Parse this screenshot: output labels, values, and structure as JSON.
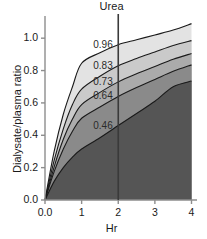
{
  "chart_data": {
    "type": "area",
    "title": "Urea",
    "xlabel": "Hr",
    "ylabel": "Dialysate/plasma ratio",
    "xlim": [
      0,
      4.15
    ],
    "ylim": [
      0,
      1.1
    ],
    "grid": false,
    "legend_position": "none",
    "xticks": [
      "0.0",
      "1",
      "2",
      "3",
      "4"
    ],
    "xtick_values": [
      0,
      1,
      2,
      3,
      4
    ],
    "yticks": [
      "0.0",
      "0.2",
      "0.4",
      "0.6",
      "0.8",
      "1.0"
    ],
    "ytick_values": [
      0.0,
      0.2,
      0.4,
      0.6,
      0.8,
      1.0
    ],
    "reference_line": {
      "orientation": "vertical",
      "x": 2,
      "label": "2 Hr transport category boundaries"
    },
    "x": [
      0,
      0.25,
      0.5,
      0.75,
      1.0,
      1.5,
      2.0,
      2.5,
      3.0,
      3.5,
      4.0
    ],
    "series": [
      {
        "name": "high (max)",
        "label_at_2hr": "0.96",
        "value_at_2hr": 0.96,
        "fill": "#e3e3e3",
        "values": [
          0.0,
          0.3,
          0.53,
          0.7,
          0.845,
          0.91,
          0.96,
          0.99,
          1.02,
          1.05,
          1.09
        ]
      },
      {
        "name": "high average upper",
        "label_at_2hr": "0.83",
        "value_at_2hr": 0.83,
        "fill": "#cacaca",
        "values": [
          0.0,
          0.245,
          0.44,
          0.59,
          0.685,
          0.765,
          0.83,
          0.875,
          0.915,
          0.955,
          0.985
        ]
      },
      {
        "name": "average",
        "label_at_2hr": "0.73",
        "value_at_2hr": 0.73,
        "fill": "#ababab",
        "values": [
          0.0,
          0.205,
          0.375,
          0.5,
          0.59,
          0.665,
          0.73,
          0.78,
          0.825,
          0.87,
          0.905
        ]
      },
      {
        "name": "low average",
        "label_at_2hr": "0.64",
        "value_at_2hr": 0.64,
        "fill": "#8a8a8a",
        "values": [
          0.0,
          0.175,
          0.315,
          0.425,
          0.505,
          0.575,
          0.64,
          0.695,
          0.745,
          0.795,
          0.835
        ]
      },
      {
        "name": "low (min)",
        "label_at_2hr": "0.46",
        "value_at_2hr": 0.46,
        "fill": "#555555",
        "values": [
          0.0,
          0.115,
          0.2,
          0.265,
          0.315,
          0.385,
          0.46,
          0.535,
          0.61,
          0.7,
          0.735
        ]
      }
    ],
    "band_labels": [
      "0.96",
      "0.83",
      "0.73",
      "0.64",
      "0.46"
    ],
    "band_fills": [
      "#e3e3e3",
      "#cacaca",
      "#ababab",
      "#8a8a8a",
      "#555555"
    ],
    "axis_color": "#8d8d8d",
    "line_color": "#1a1a1a",
    "reference_line_color": "#3a3a3a",
    "background": "#ffffff"
  }
}
